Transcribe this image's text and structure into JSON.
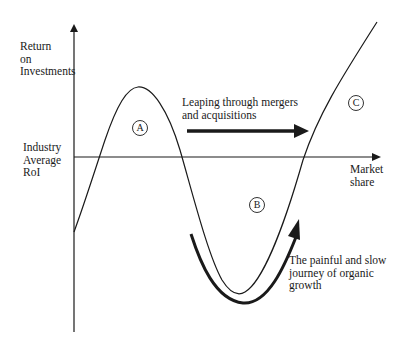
{
  "axes": {
    "y_label": [
      "Return",
      "on",
      "Investments"
    ],
    "x_label": [
      "Market",
      "share"
    ],
    "reference_line_label": [
      "Industry",
      "Average",
      "RoI"
    ]
  },
  "regions": {
    "a": "A",
    "b": "B",
    "c": "C"
  },
  "annotations": {
    "mergers": [
      "Leaping through mergers",
      "and acquisitions"
    ],
    "organic": [
      "The painful and slow",
      "journey of organic",
      "growth"
    ]
  },
  "colors": {
    "line": "#1a1a1a",
    "background": "#ffffff"
  }
}
